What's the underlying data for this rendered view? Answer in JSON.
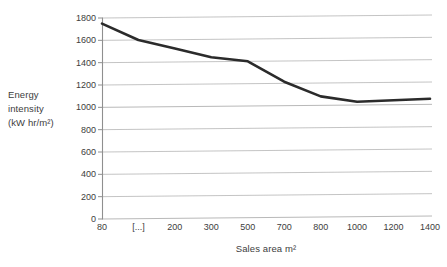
{
  "chart_data": {
    "type": "line",
    "title": "",
    "xlabel": "Sales area m²",
    "ylabel": "Energy intensity (kW hr/m²)",
    "ylabel_lines": [
      "Energy",
      "intensity",
      "(kW hr/m²)"
    ],
    "x_tick_labels": [
      "80",
      "[...]",
      "200",
      "300",
      "500",
      "700",
      "800",
      "1000",
      "1200",
      "1400"
    ],
    "y_tick_labels": [
      "0",
      "200",
      "400",
      "600",
      "800",
      "1000",
      "1200",
      "1400",
      "1600",
      "1800"
    ],
    "y_tick_values": [
      0,
      200,
      400,
      600,
      800,
      1000,
      1200,
      1400,
      1600,
      1800
    ],
    "ylim": [
      0,
      1800
    ],
    "y_major_step": 200,
    "axis_note": "x axis is categorical / broken: tick labels are evenly spaced, with a [...] break between 80 and 200",
    "grid": "horizontal",
    "legend": "none",
    "series": [
      {
        "name": "Energy intensity",
        "x_labels": [
          "80",
          "[...]",
          "200",
          "300",
          "500",
          "700",
          "800",
          "1000",
          "1200",
          "1400"
        ],
        "x_index": [
          0,
          1,
          2,
          3,
          4,
          5,
          6,
          7,
          8,
          9
        ],
        "values": [
          1750,
          1600,
          1520,
          1440,
          1400,
          1215,
          1080,
          1030,
          1040,
          1050
        ],
        "color": "#2b2b2b",
        "line_width": 2.6,
        "markers": "none"
      }
    ],
    "colors": {
      "line": "#2b2b2b",
      "grid": "#b9b9b9",
      "axis": "#8f8f8f",
      "text": "#3d3d3d",
      "background": "#ffffff"
    },
    "plot_area": {
      "left": 102,
      "right": 430,
      "top": 18,
      "bottom": 219
    }
  }
}
